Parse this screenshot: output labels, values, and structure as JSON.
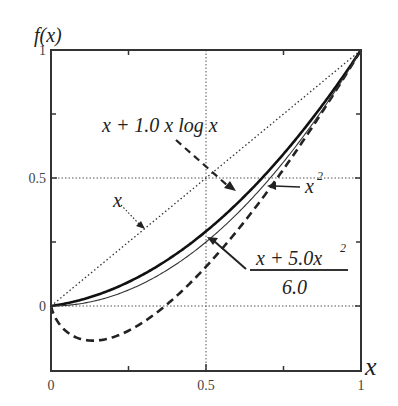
{
  "chart_data": {
    "type": "line",
    "title": "",
    "xlabel": "x",
    "ylabel": "f(x)",
    "xlim": [
      0,
      1
    ],
    "ylim": [
      -0.25,
      1
    ],
    "xticks": [
      "0",
      "0.5",
      "1"
    ],
    "yticks": [
      "0",
      "0.5",
      "1"
    ],
    "grid": "dotted at x=0.5, y=0, y=0.5",
    "legend": "none (inline arrow annotations)",
    "series": [
      {
        "name": "x",
        "style": "dotted",
        "x": [
          0,
          0.25,
          0.5,
          0.75,
          1
        ],
        "y": [
          0,
          0.25,
          0.5,
          0.75,
          1
        ]
      },
      {
        "name": "x + 1.0 x log x",
        "style": "dashed",
        "x": [
          0,
          0.1,
          0.25,
          0.5,
          0.75,
          1
        ],
        "y": [
          0,
          -0.13,
          -0.1,
          0.15,
          0.53,
          1
        ]
      },
      {
        "name": "(x + 5.0x^2)/6.0",
        "style": "thick solid",
        "x": [
          0,
          0.25,
          0.5,
          0.75,
          1
        ],
        "y": [
          0,
          0.094,
          0.292,
          0.594,
          1
        ]
      },
      {
        "name": "x^2",
        "style": "thin solid",
        "x": [
          0,
          0.25,
          0.5,
          0.75,
          1
        ],
        "y": [
          0,
          0.0625,
          0.25,
          0.5625,
          1
        ]
      }
    ],
    "annotations": [
      "x",
      "x + 1.0 x log x",
      "x^2",
      "(x + 5.0x^2) / 6.0"
    ]
  },
  "labels": {
    "ylabel": "f(x)",
    "xlabel": "x",
    "x0": "0",
    "x05": "0.5",
    "x1": "1",
    "y0": "0",
    "y05": "0.5",
    "y1": "1",
    "ann_x": "x",
    "ann_xlogx": "x + 1.0 x log x",
    "ann_x2_base": "x",
    "ann_x2_exp": "2",
    "ann_frac_num_a": "x + 5.0x",
    "ann_frac_num_exp": "2",
    "ann_frac_den": "6.0"
  }
}
